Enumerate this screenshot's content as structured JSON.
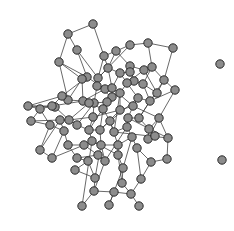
{
  "diagram": {
    "type": "network-graph",
    "node_color": "#8c8c8c",
    "node_stroke": "#2a2a2a",
    "edge_color": "#3a3a3a",
    "node_radius": 4.2,
    "nodes": [
      [
        93,
        24
      ],
      [
        68,
        34
      ],
      [
        77,
        50
      ],
      [
        59,
        62
      ],
      [
        130,
        45
      ],
      [
        148,
        43
      ],
      [
        116,
        51
      ],
      [
        173,
        48
      ],
      [
        104,
        56
      ],
      [
        87,
        77
      ],
      [
        98,
        78
      ],
      [
        82,
        79
      ],
      [
        130,
        66
      ],
      [
        144,
        70
      ],
      [
        108,
        68
      ],
      [
        130,
        72
      ],
      [
        120,
        73
      ],
      [
        134,
        81
      ],
      [
        152,
        67
      ],
      [
        105,
        89
      ],
      [
        97,
        86
      ],
      [
        112,
        88
      ],
      [
        127,
        83
      ],
      [
        143,
        84
      ],
      [
        164,
        80
      ],
      [
        112,
        97
      ],
      [
        120,
        93
      ],
      [
        157,
        93
      ],
      [
        175,
        90
      ],
      [
        150,
        101
      ],
      [
        138,
        98
      ],
      [
        120,
        110
      ],
      [
        133,
        106
      ],
      [
        107,
        102
      ],
      [
        94,
        103
      ],
      [
        93,
        117
      ],
      [
        83,
        101
      ],
      [
        68,
        100
      ],
      [
        62,
        96
      ],
      [
        89,
        103
      ],
      [
        103,
        109
      ],
      [
        55,
        107
      ],
      [
        28,
        106
      ],
      [
        52,
        106
      ],
      [
        40,
        109
      ],
      [
        69,
        120
      ],
      [
        31,
        121
      ],
      [
        60,
        120
      ],
      [
        50,
        125
      ],
      [
        77,
        125
      ],
      [
        64,
        131
      ],
      [
        89,
        130
      ],
      [
        100,
        130
      ],
      [
        110,
        121
      ],
      [
        114,
        132
      ],
      [
        128,
        118
      ],
      [
        139,
        118
      ],
      [
        159,
        118
      ],
      [
        149,
        129
      ],
      [
        127,
        127
      ],
      [
        132,
        137
      ],
      [
        148,
        139
      ],
      [
        168,
        138
      ],
      [
        118,
        145
      ],
      [
        137,
        148
      ],
      [
        101,
        145
      ],
      [
        105,
        161
      ],
      [
        40,
        150
      ],
      [
        52,
        158
      ],
      [
        68,
        145
      ],
      [
        84,
        145
      ],
      [
        92,
        141
      ],
      [
        118,
        155
      ],
      [
        123,
        168
      ],
      [
        95,
        178
      ],
      [
        94,
        191
      ],
      [
        114,
        192
      ],
      [
        131,
        194
      ],
      [
        141,
        179
      ],
      [
        109,
        205
      ],
      [
        82,
        206
      ],
      [
        75,
        170
      ],
      [
        122,
        183
      ],
      [
        151,
        162
      ],
      [
        155,
        136
      ],
      [
        167,
        159
      ],
      [
        98,
        155
      ],
      [
        77,
        158
      ],
      [
        88,
        161
      ],
      [
        139,
        206
      ],
      [
        220,
        64
      ],
      [
        222,
        160
      ]
    ],
    "edges": [
      [
        0,
        1
      ],
      [
        0,
        8
      ],
      [
        1,
        2
      ],
      [
        1,
        3
      ],
      [
        2,
        9
      ],
      [
        3,
        11
      ],
      [
        3,
        9
      ],
      [
        4,
        5
      ],
      [
        4,
        6
      ],
      [
        5,
        7
      ],
      [
        6,
        8
      ],
      [
        6,
        12
      ],
      [
        7,
        24
      ],
      [
        8,
        10
      ],
      [
        8,
        14
      ],
      [
        9,
        11
      ],
      [
        9,
        19
      ],
      [
        10,
        14
      ],
      [
        10,
        20
      ],
      [
        11,
        36
      ],
      [
        12,
        13
      ],
      [
        12,
        15
      ],
      [
        13,
        18
      ],
      [
        14,
        16
      ],
      [
        15,
        16
      ],
      [
        15,
        17
      ],
      [
        16,
        21
      ],
      [
        17,
        22
      ],
      [
        18,
        23
      ],
      [
        18,
        24
      ],
      [
        19,
        20
      ],
      [
        19,
        21
      ],
      [
        20,
        34
      ],
      [
        21,
        25
      ],
      [
        22,
        26
      ],
      [
        22,
        30
      ],
      [
        23,
        27
      ],
      [
        24,
        27
      ],
      [
        24,
        28
      ],
      [
        25,
        26
      ],
      [
        25,
        33
      ],
      [
        26,
        31
      ],
      [
        27,
        29
      ],
      [
        28,
        57
      ],
      [
        29,
        30
      ],
      [
        29,
        56
      ],
      [
        30,
        32
      ],
      [
        31,
        32
      ],
      [
        31,
        35
      ],
      [
        32,
        55
      ],
      [
        33,
        34
      ],
      [
        33,
        40
      ],
      [
        34,
        35
      ],
      [
        35,
        45
      ],
      [
        36,
        37
      ],
      [
        36,
        39
      ],
      [
        37,
        38
      ],
      [
        38,
        43
      ],
      [
        39,
        40
      ],
      [
        40,
        53
      ],
      [
        41,
        43
      ],
      [
        41,
        45
      ],
      [
        42,
        44
      ],
      [
        42,
        43
      ],
      [
        44,
        48
      ],
      [
        45,
        47
      ],
      [
        45,
        49
      ],
      [
        46,
        48
      ],
      [
        47,
        50
      ],
      [
        48,
        50
      ],
      [
        49,
        51
      ],
      [
        50,
        68
      ],
      [
        51,
        52
      ],
      [
        51,
        71
      ],
      [
        52,
        53
      ],
      [
        53,
        54
      ],
      [
        54,
        59
      ],
      [
        55,
        56
      ],
      [
        55,
        59
      ],
      [
        56,
        58
      ],
      [
        57,
        58
      ],
      [
        57,
        62
      ],
      [
        58,
        61
      ],
      [
        59,
        60
      ],
      [
        60,
        63
      ],
      [
        60,
        64
      ],
      [
        61,
        84
      ],
      [
        62,
        85
      ],
      [
        63,
        72
      ],
      [
        64,
        78
      ],
      [
        65,
        66
      ],
      [
        65,
        71
      ],
      [
        66,
        75
      ],
      [
        67,
        68
      ],
      [
        68,
        70
      ],
      [
        69,
        70
      ],
      [
        70,
        86
      ],
      [
        71,
        72
      ],
      [
        72,
        73
      ],
      [
        73,
        82
      ],
      [
        74,
        75
      ],
      [
        74,
        81
      ],
      [
        75,
        76
      ],
      [
        76,
        77
      ],
      [
        77,
        78
      ],
      [
        78,
        83
      ],
      [
        79,
        76
      ],
      [
        80,
        75
      ],
      [
        81,
        88
      ],
      [
        82,
        77
      ],
      [
        83,
        85
      ],
      [
        86,
        87
      ],
      [
        87,
        88
      ],
      [
        88,
        74
      ],
      [
        89,
        77
      ],
      [
        19,
        36
      ],
      [
        25,
        20
      ],
      [
        21,
        32
      ],
      [
        12,
        17
      ],
      [
        13,
        22
      ],
      [
        23,
        29
      ],
      [
        30,
        53
      ],
      [
        26,
        54
      ],
      [
        31,
        52
      ],
      [
        33,
        51
      ],
      [
        34,
        49
      ],
      [
        39,
        45
      ],
      [
        40,
        52
      ],
      [
        44,
        46
      ],
      [
        47,
        67
      ],
      [
        50,
        69
      ],
      [
        52,
        65
      ],
      [
        53,
        63
      ],
      [
        54,
        62
      ],
      [
        55,
        62
      ],
      [
        59,
        66
      ],
      [
        60,
        73
      ],
      [
        61,
        57
      ],
      [
        64,
        83
      ],
      [
        65,
        74
      ],
      [
        69,
        87
      ],
      [
        71,
        80
      ],
      [
        72,
        82
      ],
      [
        2,
        10
      ],
      [
        4,
        10
      ],
      [
        5,
        18
      ],
      [
        6,
        14
      ],
      [
        9,
        38
      ],
      [
        11,
        37
      ],
      [
        14,
        21
      ],
      [
        16,
        22
      ],
      [
        17,
        23
      ],
      [
        24,
        56
      ],
      [
        28,
        29
      ],
      [
        35,
        51
      ],
      [
        41,
        42
      ],
      [
        46,
        47
      ],
      [
        48,
        67
      ],
      [
        63,
        65
      ],
      [
        66,
        86
      ],
      [
        73,
        79
      ],
      [
        13,
        27
      ],
      [
        32,
        57
      ],
      [
        3,
        37
      ],
      [
        42,
        38
      ],
      [
        43,
        44
      ],
      [
        36,
        43
      ]
    ]
  }
}
